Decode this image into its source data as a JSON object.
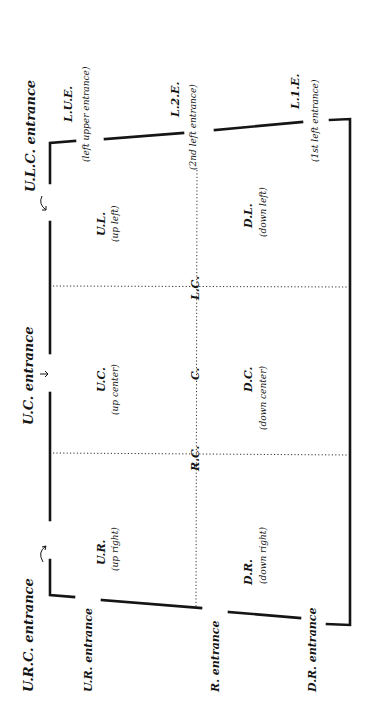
{
  "diagram": {
    "orientation": "rotated 90 degrees counter-clockwise (upstage on left, audience on right)",
    "upstage_entrances": [
      {
        "label": "U.L.C. entrance"
      },
      {
        "label": "U.C. entrance"
      },
      {
        "label": "U.R.C. entrance"
      }
    ],
    "left_entrances": [
      {
        "abbr": "L.U.E.",
        "full": "(left upper entrance)"
      },
      {
        "abbr": "L.2.E.",
        "full": "(2nd left entrance)"
      },
      {
        "abbr": "L.1.E.",
        "full": "(1st left entrance)"
      }
    ],
    "right_entrances": [
      {
        "label": "U.R. entrance"
      },
      {
        "label": "R. entrance"
      },
      {
        "label": "D.R. entrance"
      }
    ],
    "areas": [
      {
        "abbr": "U.L.",
        "full": "(up left)"
      },
      {
        "abbr": "U.C.",
        "full": "(up center)"
      },
      {
        "abbr": "U.R.",
        "full": "(up right)"
      },
      {
        "abbr": "D.L.",
        "full": "(down left)"
      },
      {
        "abbr": "D.C.",
        "full": "(down center)"
      },
      {
        "abbr": "D.R.",
        "full": "(down right)"
      }
    ],
    "center_points": [
      {
        "label": "L.C."
      },
      {
        "label": "C."
      },
      {
        "label": "R.C."
      }
    ],
    "arrow_glyph": "↓",
    "curved_arrow_glyph": "↷"
  }
}
